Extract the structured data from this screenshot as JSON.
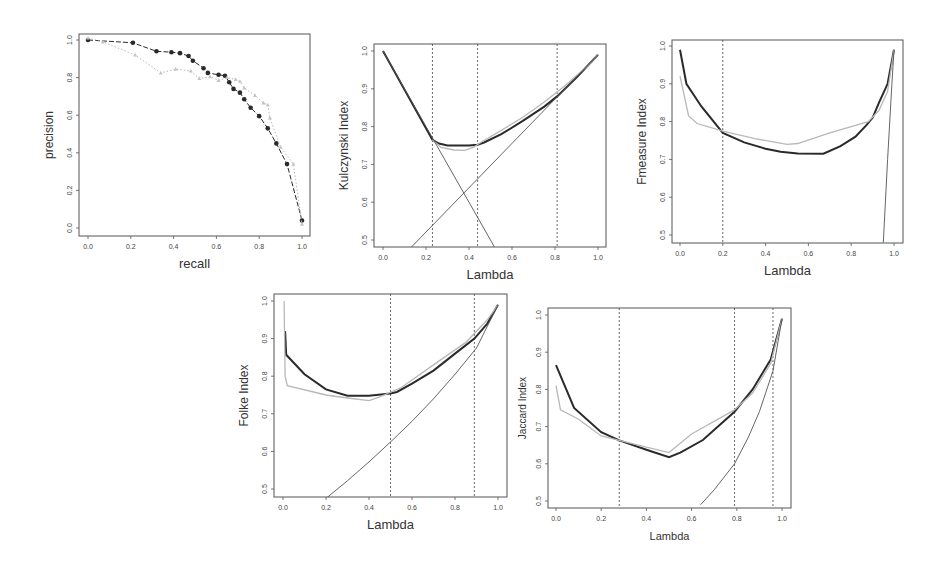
{
  "figure": {
    "background": "#ffffff",
    "colors": {
      "dark": "#2a2a2a",
      "light": "#b8b8b8",
      "axis": "#555555",
      "vline": "#444444"
    }
  },
  "chart_data": [
    {
      "id": "pr",
      "type": "line",
      "title": "",
      "xlabel": "recall",
      "ylabel": "precision",
      "xlim": [
        0,
        1
      ],
      "ylim": [
        0,
        1
      ],
      "xticks": [
        "0.0",
        "0.2",
        "0.4",
        "0.6",
        "0.8",
        "1.0"
      ],
      "yticks": [
        "0.0",
        "0.2",
        "0.4",
        "0.6",
        "0.8",
        "1.0"
      ],
      "grid": false,
      "box": {
        "left": 79,
        "top": 34,
        "right": 310,
        "bottom": 236,
        "x0px": 88,
        "x1px": 302,
        "y0px": 228,
        "y1px": 40
      },
      "series": [
        {
          "name": "dark (filled circles)",
          "style": "dark-dashed-points",
          "x": [
            0.0,
            0.21,
            0.32,
            0.39,
            0.43,
            0.47,
            0.49,
            0.54,
            0.56,
            0.61,
            0.64,
            0.66,
            0.68,
            0.71,
            0.73,
            0.76,
            0.8,
            0.84,
            0.88,
            0.93,
            1.0
          ],
          "y": [
            1.0,
            0.985,
            0.94,
            0.935,
            0.93,
            0.915,
            0.89,
            0.85,
            0.825,
            0.815,
            0.81,
            0.775,
            0.74,
            0.72,
            0.685,
            0.64,
            0.595,
            0.53,
            0.45,
            0.34,
            0.04
          ]
        },
        {
          "name": "light (triangles)",
          "style": "light-dotted-points",
          "x": [
            0.0,
            0.07,
            0.22,
            0.34,
            0.41,
            0.48,
            0.52,
            0.57,
            0.61,
            0.65,
            0.69,
            0.71,
            0.73,
            0.78,
            0.82,
            0.84,
            0.85,
            0.9,
            0.96,
            1.0
          ],
          "y": [
            1.01,
            0.99,
            0.92,
            0.825,
            0.845,
            0.835,
            0.795,
            0.805,
            0.785,
            0.8,
            0.79,
            0.78,
            0.745,
            0.705,
            0.665,
            0.655,
            0.585,
            0.43,
            0.34,
            0.02
          ]
        }
      ],
      "vlines": []
    },
    {
      "id": "kulczynski",
      "type": "line",
      "xlabel": "Lambda",
      "ylabel": "Kulczynski Index",
      "xlim": [
        0,
        1
      ],
      "ylim": [
        0.5,
        1.0
      ],
      "xticks": [
        "0.0",
        "0.2",
        "0.4",
        "0.6",
        "0.8",
        "1.0"
      ],
      "yticks": [
        "0.5",
        "0.6",
        "0.7",
        "0.8",
        "0.9",
        "1.0"
      ],
      "grid": false,
      "box": {
        "left": 374,
        "top": 44,
        "right": 606,
        "bottom": 247,
        "x0px": 383,
        "x1px": 598,
        "y0px": 240,
        "y1px": 51
      },
      "series": [
        {
          "name": "dark thick",
          "style": "dark-thick",
          "x": [
            0.0,
            0.23,
            0.26,
            0.3,
            0.35,
            0.4,
            0.44,
            0.47,
            0.55,
            0.65,
            0.75,
            0.81,
            0.9,
            1.0
          ],
          "y": [
            1.0,
            0.765,
            0.755,
            0.75,
            0.75,
            0.75,
            0.752,
            0.758,
            0.78,
            0.815,
            0.853,
            0.88,
            0.93,
            0.99
          ]
        },
        {
          "name": "light",
          "style": "light",
          "x": [
            0.23,
            0.27,
            0.33,
            0.38,
            0.42,
            0.46,
            0.55,
            0.65,
            0.75,
            0.85,
            0.95,
            1.0
          ],
          "y": [
            0.765,
            0.745,
            0.738,
            0.737,
            0.745,
            0.76,
            0.79,
            0.825,
            0.865,
            0.91,
            0.96,
            0.99
          ]
        },
        {
          "name": "line decreasing",
          "style": "thin",
          "x": [
            0.0,
            0.52
          ],
          "y": [
            1.0,
            0.48
          ]
        },
        {
          "name": "line increasing",
          "style": "thin",
          "x": [
            0.13,
            1.0
          ],
          "y": [
            0.48,
            0.99
          ]
        }
      ],
      "vlines": [
        0.23,
        0.44,
        0.81
      ]
    },
    {
      "id": "fmeasure",
      "type": "line",
      "xlabel": "Lambda",
      "ylabel": "Fmeasure Index",
      "xlim": [
        0,
        1
      ],
      "ylim": [
        0.5,
        1.0
      ],
      "xticks": [
        "0.0",
        "0.2",
        "0.4",
        "0.6",
        "0.8",
        "1.0"
      ],
      "yticks": [
        "0.5",
        "0.6",
        "0.7",
        "0.8",
        "0.9",
        "1.0"
      ],
      "grid": false,
      "box": {
        "left": 672,
        "top": 40,
        "right": 903,
        "bottom": 243,
        "x0px": 680,
        "x1px": 894,
        "y0px": 235,
        "y1px": 46
      },
      "series": [
        {
          "name": "dark thick",
          "style": "dark-thick",
          "x": [
            0.0,
            0.03,
            0.1,
            0.2,
            0.3,
            0.4,
            0.47,
            0.55,
            0.67,
            0.75,
            0.82,
            0.87,
            0.9,
            0.93,
            0.97,
            1.0
          ],
          "y": [
            0.99,
            0.9,
            0.84,
            0.77,
            0.745,
            0.728,
            0.72,
            0.716,
            0.715,
            0.735,
            0.76,
            0.79,
            0.81,
            0.85,
            0.9,
            0.99
          ]
        },
        {
          "name": "light",
          "style": "light",
          "x": [
            0.0,
            0.04,
            0.08,
            0.2,
            0.35,
            0.5,
            0.55,
            0.7,
            0.88,
            0.93,
            0.97,
            1.0
          ],
          "y": [
            0.92,
            0.815,
            0.795,
            0.775,
            0.755,
            0.74,
            0.742,
            0.77,
            0.8,
            0.83,
            0.88,
            0.99
          ]
        },
        {
          "name": "steep curve",
          "style": "thin",
          "x": [
            0.95,
            0.97,
            0.99,
            1.0
          ],
          "y": [
            0.48,
            0.7,
            0.9,
            0.99
          ]
        }
      ],
      "vlines": [
        0.2
      ]
    },
    {
      "id": "folke",
      "type": "line",
      "xlabel": "Lambda",
      "ylabel": "Folke Index",
      "xlim": [
        0,
        1
      ],
      "ylim": [
        0.5,
        1.0
      ],
      "xticks": [
        "0.0",
        "0.2",
        "0.4",
        "0.6",
        "0.8",
        "1.0"
      ],
      "yticks": [
        "0.5",
        "0.6",
        "0.7",
        "0.8",
        "0.9",
        "1.0"
      ],
      "grid": false,
      "box": {
        "left": 274,
        "top": 294,
        "right": 507,
        "bottom": 497,
        "x0px": 283,
        "x1px": 498,
        "y0px": 489,
        "y1px": 301
      },
      "series": [
        {
          "name": "dark thick",
          "style": "dark-thick",
          "x": [
            0.01,
            0.015,
            0.1,
            0.2,
            0.3,
            0.4,
            0.5,
            0.53,
            0.6,
            0.7,
            0.8,
            0.89,
            0.95,
            1.0
          ],
          "y": [
            0.92,
            0.857,
            0.805,
            0.765,
            0.748,
            0.748,
            0.754,
            0.758,
            0.78,
            0.815,
            0.86,
            0.9,
            0.94,
            0.99
          ]
        },
        {
          "name": "light",
          "style": "light",
          "x": [
            0.005,
            0.01,
            0.02,
            0.2,
            0.3,
            0.4,
            0.45,
            0.55,
            0.7,
            0.85,
            0.95,
            1.0
          ],
          "y": [
            1.0,
            0.8,
            0.775,
            0.75,
            0.742,
            0.735,
            0.745,
            0.77,
            0.83,
            0.89,
            0.95,
            0.99
          ]
        },
        {
          "name": "convex curve",
          "style": "thin",
          "x": [
            0.2,
            0.3,
            0.4,
            0.5,
            0.6,
            0.7,
            0.8,
            0.9,
            1.0
          ],
          "y": [
            0.475,
            0.522,
            0.572,
            0.625,
            0.68,
            0.74,
            0.805,
            0.875,
            0.99
          ]
        }
      ],
      "vlines": [
        0.5,
        0.89
      ]
    },
    {
      "id": "jaccard",
      "type": "line",
      "xlabel": "Lambda",
      "ylabel": "Jaccard Index",
      "xlim": [
        0,
        1
      ],
      "ylim": [
        0.5,
        1.0
      ],
      "xticks": [
        "0.0",
        "0.2",
        "0.4",
        "0.6",
        "0.8",
        "1.0"
      ],
      "yticks": [
        "0.5",
        "0.6",
        "0.7",
        "0.8",
        "0.9",
        "1.0"
      ],
      "grid": false,
      "box": {
        "left": 548,
        "top": 308,
        "right": 791,
        "bottom": 508,
        "x0px": 556,
        "x1px": 782,
        "y0px": 501,
        "y1px": 315
      },
      "series": [
        {
          "name": "dark thick",
          "style": "dark-thick",
          "x": [
            0.0,
            0.08,
            0.2,
            0.28,
            0.4,
            0.5,
            0.55,
            0.65,
            0.79,
            0.87,
            0.95,
            1.0
          ],
          "y": [
            0.865,
            0.75,
            0.685,
            0.663,
            0.638,
            0.618,
            0.63,
            0.664,
            0.74,
            0.8,
            0.88,
            0.99
          ]
        },
        {
          "name": "light",
          "style": "light",
          "x": [
            0.0,
            0.02,
            0.1,
            0.2,
            0.28,
            0.4,
            0.5,
            0.6,
            0.79,
            0.87,
            0.95,
            1.0
          ],
          "y": [
            0.81,
            0.745,
            0.72,
            0.675,
            0.663,
            0.645,
            0.63,
            0.68,
            0.745,
            0.79,
            0.87,
            0.99
          ]
        },
        {
          "name": "convex curve",
          "style": "thin",
          "x": [
            0.64,
            0.7,
            0.79,
            0.85,
            0.9,
            0.96,
            1.0
          ],
          "y": [
            0.49,
            0.53,
            0.6,
            0.67,
            0.74,
            0.85,
            0.99
          ]
        }
      ],
      "vlines": [
        0.28,
        0.79,
        0.96
      ]
    }
  ]
}
